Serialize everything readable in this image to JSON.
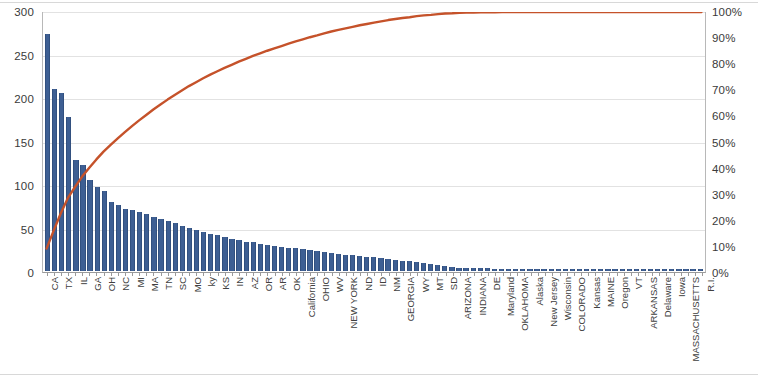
{
  "chart_data": {
    "type": "bar",
    "title": "",
    "subtitle": "",
    "xlabel": "",
    "ylabel": "",
    "y2label": "",
    "ylim": [
      0,
      300
    ],
    "y2lim": [
      0,
      100
    ],
    "grid": true,
    "legend": "none",
    "bar_color": "#3E5F93",
    "line_color": "#C5522A",
    "y_ticks": [
      "0",
      "50",
      "100",
      "150",
      "200",
      "250",
      "300"
    ],
    "y2_ticks": [
      "0%",
      "10%",
      "20%",
      "30%",
      "40%",
      "50%",
      "60%",
      "70%",
      "80%",
      "90%",
      "100%"
    ],
    "categories": [
      "CA",
      "",
      "TX",
      "",
      "IL",
      "",
      "GA",
      "",
      "OH",
      "",
      "NC",
      "",
      "MI",
      "",
      "MA",
      "",
      "TN",
      "",
      "SC",
      "",
      "MO",
      "",
      "ky",
      "",
      "KS",
      "",
      "IN",
      "",
      "AZ",
      "",
      "OR",
      "",
      "AR",
      "",
      "OK",
      "",
      "California",
      "",
      "OHIO",
      "",
      "WV",
      "",
      "NEW YORK",
      "",
      "ND",
      "",
      "ID",
      "",
      "NM",
      "",
      "GEORGIA",
      "",
      "WY",
      "",
      "MT",
      "",
      "SD",
      "",
      "ARIZONA",
      "",
      "INDIANA",
      "",
      "DE",
      "",
      "Maryland",
      "",
      "OKLAHOMA",
      "",
      "Alaska",
      "",
      "New Jersey",
      "",
      "Wisconsin",
      "",
      "COLORADO",
      "",
      "Kansas",
      "",
      "MAINE",
      "",
      "Oregon",
      "",
      "VT",
      "",
      "ARKANSAS",
      "",
      "Delaware",
      "",
      "Iowa",
      "",
      "MASSACHUSETTS",
      "",
      "R.I."
    ],
    "all_labels": [
      "CA",
      "TX",
      "IL",
      "GA",
      "OH",
      "NC",
      "MI",
      "MA",
      "TN",
      "SC",
      "MO",
      "ky",
      "KS",
      "IN",
      "AZ",
      "OR",
      "AR",
      "OK",
      "California",
      "OHIO",
      "WV",
      "NEW YORK",
      "ND",
      "ID",
      "NM",
      "GEORGIA",
      "WY",
      "MT",
      "SD",
      "ARIZONA",
      "INDIANA",
      "DE",
      "Maryland",
      "OKLAHOMA",
      "Alaska",
      "New Jersey",
      "Wisconsin",
      "COLORADO",
      "Kansas",
      "MAINE",
      "Oregon",
      "VT",
      "ARKANSAS",
      "Delaware",
      "Iowa",
      "MASSACHUSETTS",
      "R.I."
    ],
    "values": [
      273,
      210,
      205,
      178,
      128,
      122,
      105,
      97,
      92,
      80,
      76,
      72,
      70,
      68,
      66,
      62,
      60,
      58,
      55,
      52,
      50,
      47,
      45,
      43,
      41,
      39,
      37,
      36,
      34,
      33,
      31,
      30,
      29,
      28,
      27,
      26,
      25,
      24,
      23,
      22,
      21,
      20,
      19,
      18,
      17,
      16,
      16,
      15,
      14,
      13,
      12,
      11,
      10,
      9,
      8,
      7,
      6,
      5,
      4,
      3,
      3,
      3,
      3,
      2,
      2,
      2,
      2,
      2,
      2,
      2,
      2,
      2,
      2,
      2,
      2,
      2,
      2,
      2,
      2,
      2,
      2,
      2,
      2,
      2,
      2,
      2,
      2,
      2,
      2,
      2,
      2,
      2,
      2
    ],
    "cumulative_percent": [
      9.0,
      15.9,
      22.6,
      28.5,
      32.7,
      36.7,
      40.1,
      43.3,
      46.3,
      48.9,
      51.4,
      53.8,
      56.1,
      58.3,
      60.4,
      62.5,
      64.4,
      66.3,
      68.1,
      69.8,
      71.5,
      73.0,
      74.5,
      75.9,
      77.2,
      78.5,
      79.7,
      80.9,
      82.0,
      83.1,
      84.1,
      85.1,
      86.0,
      86.9,
      87.8,
      88.7,
      89.5,
      90.3,
      91.0,
      91.8,
      92.5,
      93.1,
      93.7,
      94.3,
      94.9,
      95.4,
      95.9,
      96.4,
      96.9,
      97.3,
      97.7,
      98.0,
      98.4,
      98.7,
      98.9,
      99.2,
      99.4,
      99.5,
      99.7,
      99.8,
      99.8,
      99.9,
      99.9,
      99.9,
      100.0,
      100.0,
      100.0,
      100.0,
      100.0,
      100.0,
      100.0,
      100.0,
      100.0,
      100.0,
      100.0,
      100.0,
      100.0,
      100.0,
      100.0,
      100.0,
      100.0,
      100.0,
      100.0,
      100.0,
      100.0,
      100.0,
      100.0,
      100.0,
      100.0,
      100.0,
      100.0,
      100.0,
      100.0
    ]
  }
}
